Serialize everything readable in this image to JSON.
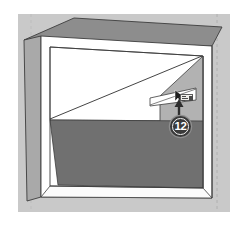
{
  "app": {
    "title": "SketchUp — Interior Box Modeling Step",
    "canvas": {
      "width": 247,
      "height": 226
    }
  },
  "colors": {
    "page_background": "#ffffff",
    "scene_background": "#c9c9c9",
    "box_top_face": "#8d8d8d",
    "box_left_face": "#a9a9a9",
    "box_front_rim": "#ffffff",
    "interior_back_wall": "#ffffff",
    "interior_side_wall": "#b0b0b0",
    "interior_floor": "#707070",
    "edge_line": "#3c3c3c",
    "guide_dashed": "#b4b4b4",
    "badge_fill": "#3a3a3a",
    "badge_text": "#ffffff",
    "arrow": "#2e2e2e",
    "highlight_face_fill": "#ffffff",
    "tooltip_fill": "#efeeea"
  },
  "scene": {
    "description": "Axonometric open-front rectangular box (room shell) with a diagonal construction line drawn across the white back wall, a small highlighted rectangular face near the right, and a numbered step callout.",
    "labels": {
      "top_face": "box-top-face",
      "left_face": "box-left-face",
      "front_rim": "box-front-rim",
      "back_wall": "interior-back-wall",
      "right_wall": "interior-right-wall",
      "floor": "interior-floor",
      "diagonal": "diagonal-construction-line",
      "highlight": "highlighted-face"
    }
  },
  "annotations": {
    "step_badge": {
      "number": "12",
      "shape": "circle",
      "icon": "step-number-badge"
    },
    "arrow": {
      "icon": "arrow-up-icon",
      "points_to": "highlighted-face"
    },
    "cursor": {
      "icon": "select-cursor-icon"
    },
    "tooltip": {
      "icon": "measurement-chip-icon"
    }
  },
  "guides": {
    "vertical_dashed_x": 217
  },
  "geometry": {
    "scene_rect": {
      "x": 18,
      "y": 14,
      "w": 212,
      "h": 198
    },
    "box_top_face": "24,40 74,18 222,27 212,46",
    "box_left_face": "24,40 41,36 41,196 27,200",
    "front_rim_outer": "41,36 212,46 212,198 41,196",
    "front_rim_inner": "50,46 203,55 203,188 50,186",
    "back_wall": "50,47 203,55 203,120 50,120",
    "right_wall": "203,55 203,188 160,160 160,96",
    "floor": "50,120 160,96 203,120 203,188 50,186",
    "diagonal_from": {
      "x": 50,
      "y": 119
    },
    "diagonal_to": {
      "x": 202,
      "y": 56
    },
    "highlight_rect": "150,97 196,88 196,99 150,105"
  }
}
